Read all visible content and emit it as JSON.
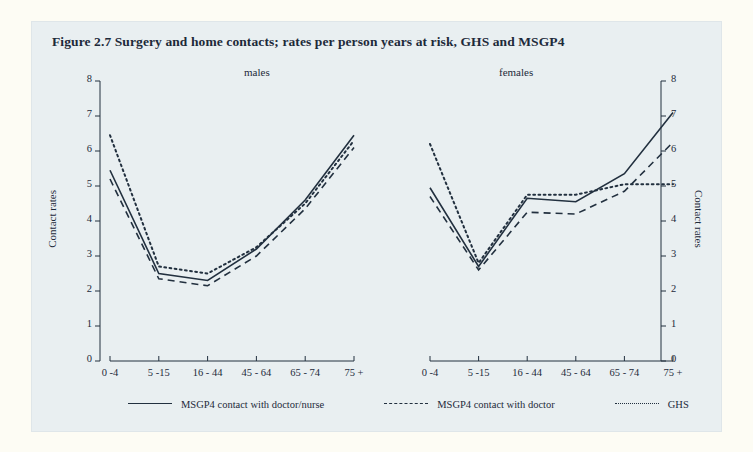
{
  "figure": {
    "title": "Figure 2.7  Surgery and home contacts; rates per person years at risk, GHS and MSGP4",
    "background_color": "#e9eff1",
    "page_color": "#fdfcf4",
    "ink_color": "#22303f"
  },
  "axes": {
    "y_label_left": "Contact rates",
    "y_label_right": "Contact rates",
    "y_ticks": [
      "0",
      "1",
      "2",
      "3",
      "4",
      "5",
      "6",
      "7",
      "8"
    ]
  },
  "legend": {
    "items": [
      {
        "key": "solid",
        "label": "MSGP4 contact with doctor/nurse"
      },
      {
        "key": "dashed",
        "label": "MSGP4 contact with doctor"
      },
      {
        "key": "dotted",
        "label": "GHS"
      }
    ]
  },
  "chart_data": {
    "type": "line",
    "title": "Figure 2.7  Surgery and home contacts; rates per person years at risk, GHS and MSGP4",
    "xlabel": "",
    "ylabel": "Contact rates",
    "ylim": [
      0,
      8
    ],
    "grid": false,
    "legend_position": "bottom",
    "categories": [
      "0 -4",
      "5 -15",
      "16 - 44",
      "45 - 64",
      "65 - 74",
      "75 +"
    ],
    "panels": [
      {
        "name": "males",
        "series": [
          {
            "name": "MSGP4 contact with doctor/nurse",
            "style": "solid",
            "values": [
              5.45,
              2.5,
              2.3,
              3.2,
              4.6,
              6.45
            ]
          },
          {
            "name": "MSGP4 contact with doctor",
            "style": "dashed",
            "values": [
              5.2,
              2.35,
              2.15,
              3.0,
              4.35,
              6.1
            ]
          },
          {
            "name": "GHS",
            "style": "dotted",
            "values": [
              6.45,
              2.7,
              2.5,
              3.25,
              4.5,
              6.3
            ]
          }
        ]
      },
      {
        "name": "females",
        "series": [
          {
            "name": "MSGP4 contact with doctor/nurse",
            "style": "solid",
            "values": [
              4.95,
              2.7,
              4.65,
              4.55,
              5.35,
              7.1
            ]
          },
          {
            "name": "MSGP4 contact with doctor",
            "style": "dashed",
            "values": [
              4.7,
              2.6,
              4.25,
              4.2,
              4.85,
              6.25
            ]
          },
          {
            "name": "GHS",
            "style": "dotted",
            "values": [
              6.2,
              2.8,
              4.75,
              4.75,
              5.05,
              5.05
            ]
          }
        ]
      }
    ]
  }
}
